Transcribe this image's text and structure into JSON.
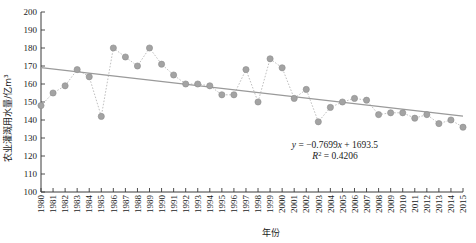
{
  "chart_data": {
    "type": "line",
    "title": "",
    "xlabel": "年份",
    "ylabel": "农业灌溉用水量/亿m³",
    "ylim": [
      100,
      200
    ],
    "ytick_step": 10,
    "yticks": [
      100,
      110,
      120,
      130,
      140,
      150,
      160,
      170,
      180,
      190,
      200
    ],
    "grid": false,
    "legend": "none",
    "marker_color": "#a3a3a3",
    "line_color": "#b9b9b9",
    "trend_color": "#9a9a9a",
    "axis_color": "#3a3a3a",
    "categories": [
      "1980",
      "1981",
      "1982",
      "1983",
      "1984",
      "1985",
      "1986",
      "1987",
      "1988",
      "1989",
      "1990",
      "1991",
      "1992",
      "1993",
      "1994",
      "1995",
      "1996",
      "1997",
      "1998",
      "1999",
      "2000",
      "2001",
      "2002",
      "2003",
      "2004",
      "2005",
      "2006",
      "2007",
      "2008",
      "2009",
      "2010",
      "2011",
      "2012",
      "2013",
      "2014",
      "2015"
    ],
    "values": [
      148,
      155,
      159,
      168,
      164,
      142,
      180,
      175,
      170,
      180,
      171,
      165,
      160,
      160,
      159,
      154,
      154,
      168,
      150,
      174,
      169,
      152,
      157,
      139,
      147,
      150,
      152,
      151,
      143,
      144,
      144,
      141,
      143,
      138,
      140,
      136
    ],
    "annotations": {
      "equation": "y = −0.7699x + 1693.5",
      "r_squared": "R² = 0.4206",
      "equation_parts": {
        "y": "y",
        "eq_rest": " = −0.7699",
        "x": "x",
        "tail": " + 1693.5"
      },
      "r_parts": {
        "r": "R",
        "sup": "2",
        "value": " = 0.4206"
      }
    },
    "trend": {
      "slope": -0.7699,
      "intercept": 1693.5,
      "r_squared": 0.4206,
      "start_year": 1980,
      "end_year": 2015
    }
  }
}
